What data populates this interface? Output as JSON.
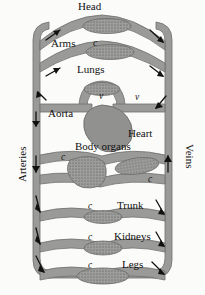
{
  "figure": {
    "colors": {
      "vessel_fill": "#9a9a98",
      "vessel_stroke": "#6e6e6c",
      "capillary_fill": "#8f8f8d",
      "heart_fill": "#919190",
      "background": "#fbfbfa",
      "text": "#111111",
      "arrow": "#111111"
    },
    "side_labels": [
      {
        "id": "arteries",
        "text": "Arteries",
        "side": "left"
      },
      {
        "id": "veins",
        "text": "Veins",
        "side": "right"
      }
    ],
    "organ_labels": [
      {
        "id": "head",
        "text": "Head"
      },
      {
        "id": "arms",
        "text": "Arms"
      },
      {
        "id": "lungs",
        "text": "Lungs"
      },
      {
        "id": "aorta",
        "text": "Aorta"
      },
      {
        "id": "heart",
        "text": "Heart"
      },
      {
        "id": "body-organs",
        "text": "Body organs"
      },
      {
        "id": "trunk",
        "text": "Trunk"
      },
      {
        "id": "kidneys",
        "text": "Kidneys"
      },
      {
        "id": "legs",
        "text": "Legs"
      }
    ],
    "capillary_marks": [
      {
        "id": "c-head",
        "text": "c"
      },
      {
        "id": "c-body-left",
        "text": "c"
      },
      {
        "id": "c-body-right",
        "text": "c"
      },
      {
        "id": "c-trunk",
        "text": "c"
      },
      {
        "id": "c-kidneys",
        "text": "c"
      },
      {
        "id": "c-legs",
        "text": "c"
      }
    ],
    "valve_marks": [
      {
        "id": "v-left",
        "text": "v"
      },
      {
        "id": "v-right",
        "text": "v"
      }
    ]
  }
}
